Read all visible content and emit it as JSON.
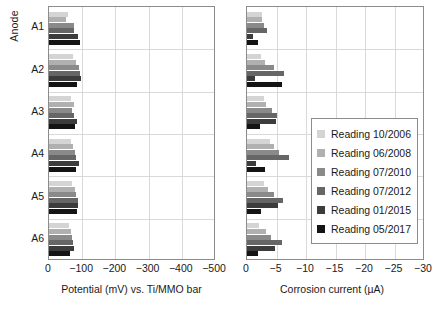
{
  "axis": {
    "y_title": "Anode",
    "categories": [
      "A1",
      "A2",
      "A3",
      "A4",
      "A5",
      "A6"
    ],
    "left_xlabel": "Potential (mV) vs. Ti/MMO bar",
    "right_xlabel": "Corrosion current (µA)",
    "left_ticks": [
      "0",
      "−100",
      "−200",
      "−300",
      "−400",
      "−500"
    ],
    "right_ticks": [
      "0",
      "−5",
      "−10",
      "−15",
      "−20",
      "−25",
      "−30"
    ]
  },
  "legend": {
    "items": [
      {
        "label": "Reading 10/2006",
        "color": "#d4d4d4"
      },
      {
        "label": "Reading 06/2008",
        "color": "#b0b0b0"
      },
      {
        "label": "Reading 07/2010",
        "color": "#8a8a8a"
      },
      {
        "label": "Reading 07/2012",
        "color": "#666666"
      },
      {
        "label": "Reading 01/2015",
        "color": "#3c3c3c"
      },
      {
        "label": "Reading 05/2017",
        "color": "#141414"
      }
    ]
  },
  "chart_data": [
    {
      "type": "bar",
      "orientation": "horizontal",
      "title": "",
      "xlabel": "Potential (mV) vs. Ti/MMO bar",
      "ylabel": "Anode",
      "categories": [
        "A1",
        "A2",
        "A3",
        "A4",
        "A5",
        "A6"
      ],
      "xlim": [
        0,
        -500
      ],
      "grid": true,
      "series": [
        {
          "name": "Reading 10/2006",
          "color": "#d4d4d4",
          "values": [
            -58,
            -72,
            -66,
            -66,
            -68,
            -60
          ]
        },
        {
          "name": "Reading 06/2008",
          "color": "#b0b0b0",
          "values": [
            -52,
            -80,
            -76,
            -72,
            -78,
            -66
          ]
        },
        {
          "name": "Reading 07/2010",
          "color": "#8a8a8a",
          "values": [
            -74,
            -90,
            -70,
            -78,
            -82,
            -68
          ]
        },
        {
          "name": "Reading 07/2012",
          "color": "#666666",
          "values": [
            -74,
            -92,
            -74,
            -82,
            -86,
            -72
          ]
        },
        {
          "name": "Reading 01/2015",
          "color": "#3c3c3c",
          "values": [
            -86,
            -96,
            -84,
            -90,
            -88,
            -76
          ]
        },
        {
          "name": "Reading 05/2017",
          "color": "#141414",
          "values": [
            -92,
            -84,
            -78,
            -80,
            -84,
            -62
          ]
        }
      ]
    },
    {
      "type": "bar",
      "orientation": "horizontal",
      "title": "",
      "xlabel": "Corrosion current (µA)",
      "ylabel": "Anode",
      "categories": [
        "A1",
        "A2",
        "A3",
        "A4",
        "A5",
        "A6"
      ],
      "xlim": [
        0,
        -30
      ],
      "grid": true,
      "series": [
        {
          "name": "Reading 10/2006",
          "color": "#d4d4d4",
          "values": [
            -2.6,
            -2.3,
            -2.8,
            -3.9,
            -2.9,
            -2.1
          ]
        },
        {
          "name": "Reading 06/2008",
          "color": "#b0b0b0",
          "values": [
            -2.5,
            -3.1,
            -3.3,
            -4.5,
            -3.6,
            -3.2
          ]
        },
        {
          "name": "Reading 07/2010",
          "color": "#8a8a8a",
          "values": [
            -2.9,
            -4.6,
            -4.2,
            -5.4,
            -4.6,
            -4.1
          ]
        },
        {
          "name": "Reading 07/2012",
          "color": "#666666",
          "values": [
            -3.4,
            -6.2,
            -5.0,
            -7.2,
            -6.1,
            -5.9
          ]
        },
        {
          "name": "Reading 01/2015",
          "color": "#3c3c3c",
          "values": [
            -1.1,
            -1.3,
            -4.9,
            -1.6,
            -5.2,
            -4.7
          ]
        },
        {
          "name": "Reading 05/2017",
          "color": "#141414",
          "values": [
            -1.9,
            -5.9,
            -2.2,
            -3.0,
            -2.3,
            -1.9
          ]
        }
      ]
    }
  ]
}
